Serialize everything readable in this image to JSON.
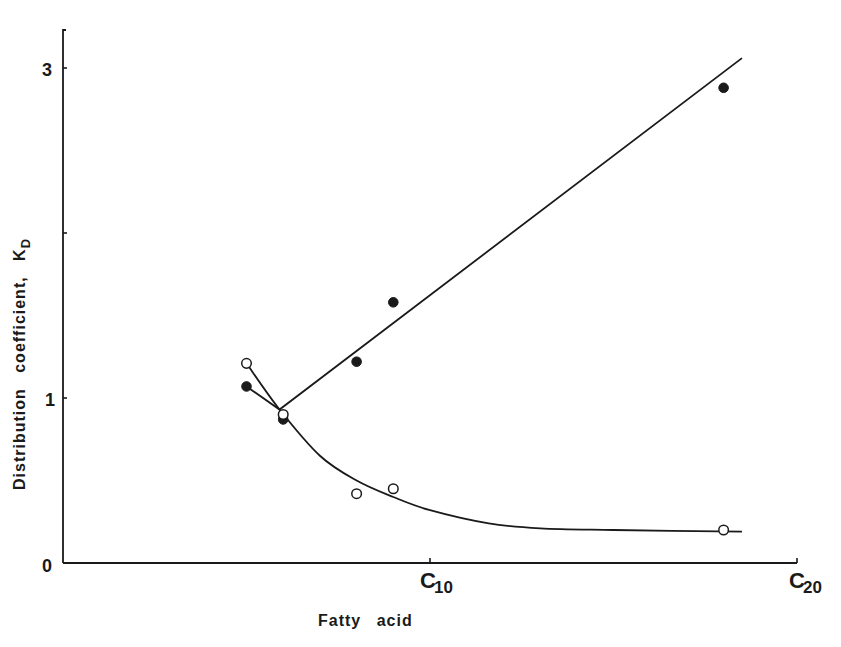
{
  "chart_data": {
    "type": "scatter",
    "title": "",
    "xlabel": "Fatty acid",
    "ylabel": "Distribution coefficient, K",
    "ylabel_subscript": "D",
    "xlim": [
      0,
      20
    ],
    "ylim": [
      0,
      3.2
    ],
    "grid": false,
    "legend": null,
    "x_ticks": [
      {
        "value": 10,
        "label": "C",
        "sub": "10"
      },
      {
        "value": 20,
        "label": "C",
        "sub": "20"
      }
    ],
    "y_ticks": [
      {
        "value": 0,
        "label": "0"
      },
      {
        "value": 1,
        "label": "1"
      },
      {
        "value": 2,
        "label": ""
      },
      {
        "value": 3,
        "label": "3"
      }
    ],
    "series": [
      {
        "name": "filled circles",
        "marker": "filled-circle",
        "x": [
          5,
          6,
          8,
          9,
          18
        ],
        "values": [
          1.07,
          0.87,
          1.22,
          1.58,
          2.88
        ],
        "fit": "line",
        "fit_points": [
          [
            5,
            1.07
          ],
          [
            5.9,
            0.93
          ],
          [
            18.5,
            3.06
          ]
        ]
      },
      {
        "name": "open circles",
        "marker": "open-circle",
        "x": [
          5,
          6,
          8,
          9,
          18
        ],
        "values": [
          1.21,
          0.9,
          0.42,
          0.45,
          0.2
        ],
        "fit": "curve",
        "fit_points": [
          [
            5,
            1.21
          ],
          [
            5.9,
            0.93
          ],
          [
            7,
            0.65
          ],
          [
            8,
            0.5
          ],
          [
            9,
            0.4
          ],
          [
            10,
            0.32
          ],
          [
            11.6,
            0.24
          ],
          [
            13,
            0.21
          ],
          [
            15,
            0.2
          ],
          [
            18.5,
            0.19
          ]
        ]
      }
    ]
  },
  "labels": {
    "x_axis_title": "Fatty acid",
    "y_axis_title": "Distribution coefficient, K",
    "y_axis_sub": "D",
    "y_tick_0": "0",
    "y_tick_1": "1",
    "y_tick_3": "3",
    "x_tick_10_main": "C",
    "x_tick_10_sub": "10",
    "x_tick_20_main": "C",
    "x_tick_20_sub": "20"
  },
  "colors": {
    "ink": "#1a1a1a",
    "background": "#ffffff"
  }
}
